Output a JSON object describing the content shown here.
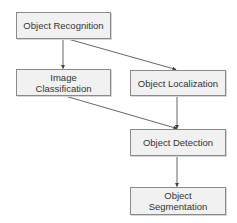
{
  "diagram": {
    "type": "flowchart",
    "nodes": [
      {
        "id": "recognition",
        "lines": [
          "Object Recognition"
        ],
        "x": 16,
        "y": 12,
        "w": 95,
        "h": 27
      },
      {
        "id": "classification",
        "lines": [
          "Image",
          "Classification"
        ],
        "x": 16,
        "y": 69,
        "w": 95,
        "h": 27
      },
      {
        "id": "localization",
        "lines": [
          "Object Localization"
        ],
        "x": 130,
        "y": 70,
        "w": 96,
        "h": 26
      },
      {
        "id": "detection",
        "lines": [
          "Object Detection"
        ],
        "x": 130,
        "y": 129,
        "w": 96,
        "h": 27
      },
      {
        "id": "segmentation",
        "lines": [
          "Object",
          "Segmentation"
        ],
        "x": 130,
        "y": 187,
        "w": 96,
        "h": 28
      }
    ],
    "edges": [
      {
        "from": "recognition",
        "to": "classification"
      },
      {
        "from": "recognition",
        "to": "localization"
      },
      {
        "from": "classification",
        "to": "detection"
      },
      {
        "from": "localization",
        "to": "detection"
      },
      {
        "from": "detection",
        "to": "segmentation"
      }
    ],
    "colors": {
      "node_fill": "#f1f1f1",
      "node_border": "#8a8a8a",
      "text": "#333333",
      "edge": "#555555"
    }
  }
}
